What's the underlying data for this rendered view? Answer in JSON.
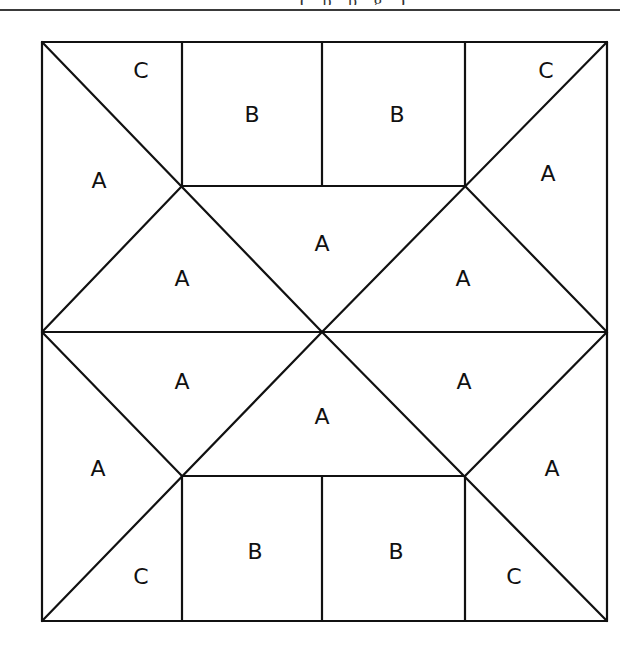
{
  "header": {
    "clipped_text": "( p  p g  )"
  },
  "diagram": {
    "piece_types": [
      "A",
      "B",
      "C"
    ],
    "pieces": [
      {
        "id": "c-top-left",
        "label": "C"
      },
      {
        "id": "b-top-1",
        "label": "B"
      },
      {
        "id": "b-top-2",
        "label": "B"
      },
      {
        "id": "c-top-right",
        "label": "C"
      },
      {
        "id": "a-left-upper",
        "label": "A"
      },
      {
        "id": "a-right-upper",
        "label": "A"
      },
      {
        "id": "a-center-top",
        "label": "A"
      },
      {
        "id": "a-upper-left-mid",
        "label": "A"
      },
      {
        "id": "a-upper-right-mid",
        "label": "A"
      },
      {
        "id": "a-lower-left-mid",
        "label": "A"
      },
      {
        "id": "a-lower-right-mid",
        "label": "A"
      },
      {
        "id": "a-center-bottom",
        "label": "A"
      },
      {
        "id": "a-left-lower",
        "label": "A"
      },
      {
        "id": "a-right-lower",
        "label": "A"
      },
      {
        "id": "c-bottom-left",
        "label": "C"
      },
      {
        "id": "b-bottom-1",
        "label": "B"
      },
      {
        "id": "b-bottom-2",
        "label": "B"
      },
      {
        "id": "c-bottom-right",
        "label": "C"
      }
    ]
  }
}
